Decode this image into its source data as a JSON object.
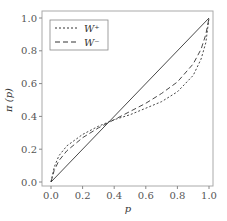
{
  "chart_data": {
    "type": "line",
    "title": "",
    "xlabel": "p",
    "ylabel": "π (p)",
    "xlim": [
      0.0,
      1.0
    ],
    "ylim": [
      0.0,
      1.0
    ],
    "xticks": [
      "0.0",
      "0.2",
      "0.4",
      "0.6",
      "0.8",
      "1.0"
    ],
    "yticks": [
      "0.0",
      "0.2",
      "0.4",
      "0.6",
      "0.8",
      "1.0"
    ],
    "grid": false,
    "legend_position": "upper left",
    "series": [
      {
        "name": "identity",
        "style": "solid",
        "x": [
          0.0,
          1.0
        ],
        "y": [
          0.0,
          1.0
        ]
      },
      {
        "name": "W+",
        "style": "dotted",
        "x": [
          0.0,
          0.02,
          0.05,
          0.1,
          0.2,
          0.3,
          0.4,
          0.5,
          0.6,
          0.7,
          0.8,
          0.9,
          0.95,
          0.98,
          1.0
        ],
        "y": [
          0.0,
          0.09,
          0.16,
          0.22,
          0.29,
          0.34,
          0.38,
          0.41,
          0.45,
          0.49,
          0.55,
          0.65,
          0.75,
          0.85,
          1.0
        ]
      },
      {
        "name": "W-",
        "style": "dashed",
        "x": [
          0.0,
          0.02,
          0.05,
          0.1,
          0.2,
          0.3,
          0.4,
          0.5,
          0.6,
          0.7,
          0.8,
          0.9,
          0.95,
          0.98,
          1.0
        ],
        "y": [
          0.0,
          0.07,
          0.13,
          0.19,
          0.27,
          0.33,
          0.38,
          0.43,
          0.48,
          0.54,
          0.61,
          0.72,
          0.81,
          0.9,
          1.0
        ]
      }
    ],
    "legend": [
      "W⁺",
      "W⁻"
    ]
  },
  "legend": {
    "w_plus": "W⁺",
    "w_minus": "W⁻"
  },
  "axes": {
    "xlabel": "p",
    "ylabel": "π (p)"
  }
}
